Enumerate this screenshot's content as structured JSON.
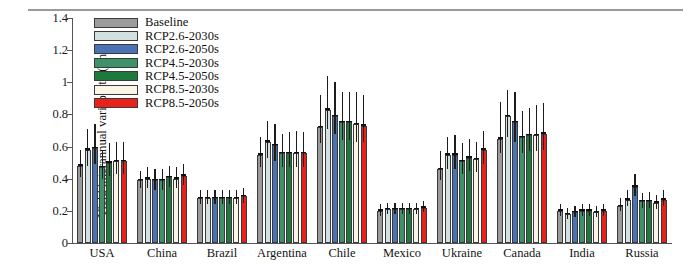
{
  "chart_data": {
    "type": "bar",
    "title": "",
    "xlabel": "",
    "ylabel": "Yield interannual variability (t/ha)",
    "ylim": [
      0,
      1.4
    ],
    "ytick_labels": [
      "0",
      "0.2",
      "0.4",
      "0.6",
      "0.8",
      "1",
      "1.2",
      "1.4"
    ],
    "ytick_values": [
      0,
      0.2,
      0.4,
      0.6,
      0.8,
      1.0,
      1.2,
      1.4
    ],
    "grid": false,
    "legend_position": "top-left",
    "categories": [
      "USA",
      "China",
      "Brazil",
      "Argentina",
      "Chile",
      "Mexico",
      "Ukraine",
      "Canada",
      "India",
      "Russia"
    ],
    "series": [
      {
        "name": "Baseline",
        "color": "#9b9b9b",
        "values": [
          0.48,
          0.39,
          0.28,
          0.55,
          0.72,
          0.2,
          0.46,
          0.65,
          0.2,
          0.23
        ],
        "err_low": [
          0.41,
          0.34,
          0.24,
          0.47,
          0.62,
          0.17,
          0.39,
          0.56,
          0.17,
          0.2
        ],
        "err_high": [
          0.58,
          0.45,
          0.33,
          0.66,
          0.92,
          0.24,
          0.57,
          0.88,
          0.24,
          0.28
        ]
      },
      {
        "name": "RCP2.6-2030s",
        "color": "#d3e0e0",
        "values": [
          0.58,
          0.4,
          0.28,
          0.63,
          0.83,
          0.21,
          0.55,
          0.79,
          0.18,
          0.27
        ],
        "err_low": [
          0.48,
          0.34,
          0.24,
          0.53,
          0.71,
          0.18,
          0.46,
          0.66,
          0.15,
          0.23
        ],
        "err_high": [
          0.71,
          0.47,
          0.33,
          0.76,
          1.04,
          0.25,
          0.66,
          0.95,
          0.22,
          0.33
        ]
      },
      {
        "name": "RCP2.6-2050s",
        "color": "#4a72b5",
        "values": [
          0.59,
          0.39,
          0.28,
          0.61,
          0.79,
          0.21,
          0.55,
          0.75,
          0.19,
          0.35
        ],
        "err_low": [
          0.49,
          0.33,
          0.24,
          0.51,
          0.68,
          0.18,
          0.46,
          0.63,
          0.16,
          0.29
        ],
        "err_high": [
          0.74,
          0.46,
          0.33,
          0.74,
          1.0,
          0.25,
          0.67,
          0.94,
          0.23,
          0.43
        ]
      },
      {
        "name": "RCP4.5-2030s",
        "color": "#3f9169",
        "values": [
          0.47,
          0.39,
          0.28,
          0.56,
          0.75,
          0.21,
          0.51,
          0.66,
          0.2,
          0.26
        ],
        "err_low": [
          0.4,
          0.33,
          0.24,
          0.47,
          0.64,
          0.18,
          0.43,
          0.56,
          0.17,
          0.22
        ],
        "err_high": [
          0.58,
          0.46,
          0.33,
          0.68,
          0.94,
          0.25,
          0.62,
          0.82,
          0.24,
          0.31
        ]
      },
      {
        "name": "RCP4.5-2050s",
        "color": "#1e7a3c",
        "values": [
          0.5,
          0.41,
          0.28,
          0.56,
          0.75,
          0.21,
          0.53,
          0.67,
          0.2,
          0.26
        ],
        "err_low": [
          0.42,
          0.35,
          0.24,
          0.47,
          0.64,
          0.18,
          0.45,
          0.57,
          0.17,
          0.22
        ],
        "err_high": [
          0.62,
          0.48,
          0.33,
          0.69,
          0.94,
          0.25,
          0.65,
          0.84,
          0.24,
          0.32
        ]
      },
      {
        "name": "RCP8.5-2030s",
        "color": "#faf5e6",
        "values": [
          0.51,
          0.4,
          0.28,
          0.56,
          0.74,
          0.21,
          0.52,
          0.67,
          0.19,
          0.25
        ],
        "err_low": [
          0.43,
          0.34,
          0.24,
          0.47,
          0.63,
          0.18,
          0.44,
          0.57,
          0.16,
          0.21
        ],
        "err_high": [
          0.63,
          0.47,
          0.33,
          0.7,
          0.94,
          0.25,
          0.63,
          0.86,
          0.23,
          0.3
        ]
      },
      {
        "name": "RCP8.5-2050s",
        "color": "#e8211a",
        "values": [
          0.51,
          0.42,
          0.29,
          0.56,
          0.73,
          0.22,
          0.58,
          0.68,
          0.2,
          0.27
        ],
        "err_low": [
          0.43,
          0.36,
          0.25,
          0.47,
          0.63,
          0.19,
          0.49,
          0.58,
          0.17,
          0.23
        ],
        "err_high": [
          0.63,
          0.49,
          0.34,
          0.69,
          0.92,
          0.26,
          0.7,
          0.87,
          0.24,
          0.33
        ]
      }
    ]
  }
}
